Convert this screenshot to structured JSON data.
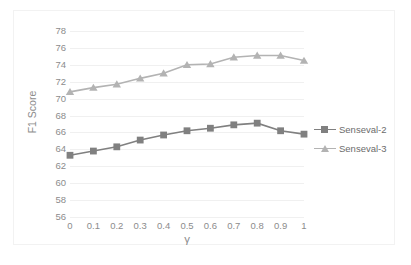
{
  "chart_data": {
    "type": "line",
    "title": "",
    "xlabel": "γ",
    "ylabel": "F1 Score",
    "x": [
      0,
      0.1,
      0.2,
      0.3,
      0.4,
      0.5,
      0.6,
      0.7,
      0.8,
      0.9,
      1
    ],
    "xtick_labels": [
      "0",
      "0.1",
      "0.2",
      "0.3",
      "0.4",
      "0.5",
      "0.6",
      "0.7",
      "0.8",
      "0.9",
      "1"
    ],
    "ytick_labels": [
      "78",
      "76",
      "74",
      "72",
      "70",
      "68",
      "66",
      "64",
      "62",
      "60",
      "58",
      "56"
    ],
    "ylim": [
      56,
      78
    ],
    "ytick_step": 2,
    "grid": "horizontal",
    "legend_position": "right",
    "series": [
      {
        "name": "Senseval-2",
        "color": "#808080",
        "marker": "square",
        "values": [
          63.3,
          63.8,
          64.3,
          65.1,
          65.7,
          66.2,
          66.5,
          66.9,
          67.1,
          66.2,
          65.8
        ]
      },
      {
        "name": "Senseval-3",
        "color": "#b3b3b3",
        "marker": "triangle",
        "values": [
          70.8,
          71.3,
          71.7,
          72.4,
          73.0,
          74.0,
          74.1,
          74.9,
          75.1,
          75.1,
          74.5
        ]
      }
    ]
  },
  "legend": {
    "items": [
      {
        "label": "Senseval-2"
      },
      {
        "label": "Senseval-3"
      }
    ]
  },
  "axes": {
    "y_title": "F1 Score",
    "x_title": "γ"
  }
}
